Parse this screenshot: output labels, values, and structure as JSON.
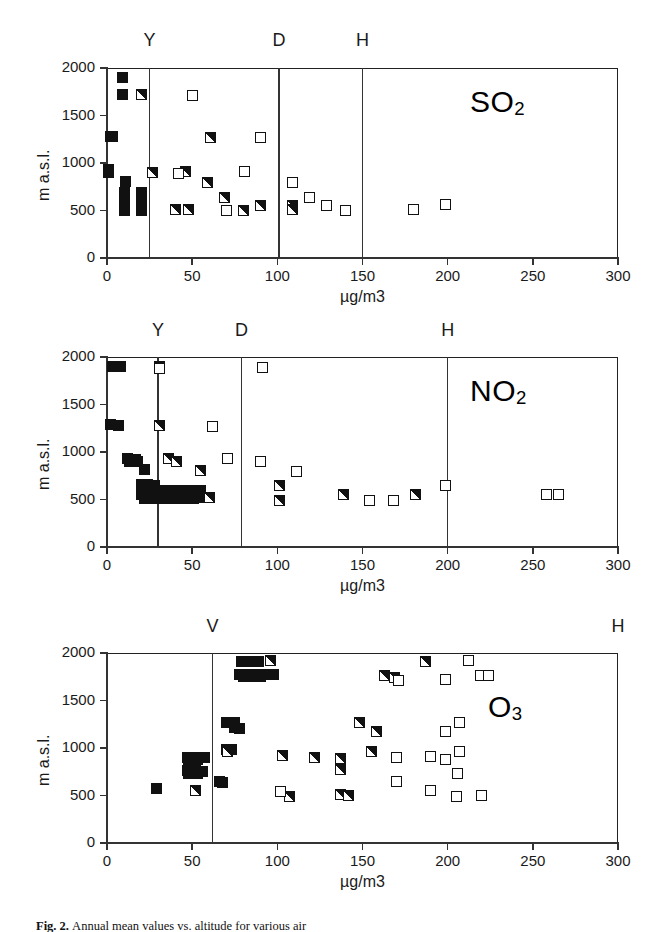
{
  "figure": {
    "caption_prefix": "Fig. 2.",
    "caption_text": "Annual mean values vs. altitude for various air"
  },
  "axes_common": {
    "xlabel": "µg/m3",
    "ylabel": "m a.s.l.",
    "xticks": [
      0,
      50,
      100,
      150,
      200,
      250,
      300
    ],
    "yticks": [
      0,
      500,
      1000,
      1500,
      2000
    ],
    "xlim": [
      0,
      300
    ],
    "ylim": [
      0,
      2000
    ],
    "grid": false
  },
  "legend_markers": {
    "filled": "filled-square",
    "half": "half-filled-square",
    "open": "open-square"
  },
  "chart_data": [
    {
      "type": "scatter",
      "title": "SO2",
      "title_plain": "SO",
      "title_sub": "2",
      "xlabel": "µg/m3",
      "ylabel": "m a.s.l.",
      "xlim": [
        0,
        300
      ],
      "ylim": [
        0,
        2000
      ],
      "xticks": [
        0,
        50,
        100,
        150,
        200,
        250,
        300
      ],
      "yticks": [
        0,
        500,
        1000,
        1500,
        2000
      ],
      "grid": false,
      "guides": [
        {
          "label": "Y",
          "x": 25
        },
        {
          "label": "D",
          "x": 101
        },
        {
          "label": "H",
          "x": 150
        }
      ],
      "series": [
        {
          "name": "filled",
          "marker": "filled-square",
          "points": [
            [
              9,
              1900
            ],
            [
              9,
              1720
            ],
            [
              2,
              1280
            ],
            [
              3,
              1275
            ],
            [
              1,
              930
            ],
            [
              1,
              900
            ],
            [
              11,
              810
            ],
            [
              10,
              690
            ],
            [
              10,
              640
            ],
            [
              10,
              590
            ],
            [
              10,
              540
            ],
            [
              10,
              500
            ],
            [
              20,
              690
            ],
            [
              20,
              640
            ],
            [
              20,
              590
            ],
            [
              20,
              540
            ],
            [
              20,
              500
            ]
          ]
        },
        {
          "name": "half",
          "marker": "half-filled-square",
          "points": [
            [
              20,
              1720
            ],
            [
              61,
              1270
            ],
            [
              27,
              900
            ],
            [
              46,
              910
            ],
            [
              59,
              800
            ],
            [
              69,
              640
            ],
            [
              40,
              510
            ],
            [
              48,
              515
            ],
            [
              80,
              505
            ],
            [
              90,
              550
            ],
            [
              109,
              555
            ],
            [
              109,
              510
            ]
          ]
        },
        {
          "name": "open",
          "marker": "open-square",
          "points": [
            [
              50,
              1710
            ],
            [
              90,
              1265
            ],
            [
              42,
              890
            ],
            [
              81,
              915
            ],
            [
              109,
              790
            ],
            [
              70,
              495
            ],
            [
              119,
              640
            ],
            [
              129,
              550
            ],
            [
              140,
              500
            ],
            [
              180,
              510
            ],
            [
              199,
              560
            ]
          ]
        }
      ]
    },
    {
      "type": "scatter",
      "title": "NO2",
      "title_plain": "NO",
      "title_sub": "2",
      "xlabel": "µg/m3",
      "ylabel": "m a.s.l.",
      "xlim": [
        0,
        300
      ],
      "ylim": [
        0,
        2000
      ],
      "xticks": [
        0,
        50,
        100,
        150,
        200,
        250,
        300
      ],
      "yticks": [
        0,
        500,
        1000,
        1500,
        2000
      ],
      "grid": false,
      "guides": [
        {
          "label": "Y",
          "x": 30
        },
        {
          "label": "D",
          "x": 79
        },
        {
          "label": "H",
          "x": 200
        }
      ],
      "series": [
        {
          "name": "filled",
          "marker": "filled-square",
          "points": [
            [
              3,
              1905
            ],
            [
              8,
              1900
            ],
            [
              2,
              1285
            ],
            [
              7,
              1280
            ],
            [
              12,
              930
            ],
            [
              17,
              925
            ],
            [
              13,
              900
            ],
            [
              18,
              900
            ],
            [
              22,
              820
            ],
            [
              20,
              660
            ],
            [
              24,
              655
            ],
            [
              28,
              650
            ],
            [
              21,
              600
            ],
            [
              25,
              600
            ],
            [
              29,
              600
            ],
            [
              33,
              600
            ],
            [
              20,
              550
            ],
            [
              24,
              550
            ],
            [
              28,
              550
            ],
            [
              32,
              550
            ],
            [
              22,
              510
            ],
            [
              26,
              510
            ],
            [
              30,
              510
            ],
            [
              34,
              510
            ],
            [
              38,
              600
            ],
            [
              42,
              600
            ],
            [
              46,
              600
            ],
            [
              50,
              600
            ],
            [
              40,
              550
            ],
            [
              44,
              550
            ],
            [
              48,
              550
            ],
            [
              52,
              550
            ],
            [
              39,
              510
            ],
            [
              43,
              510
            ],
            [
              47,
              510
            ],
            [
              51,
              510
            ],
            [
              55,
              600
            ],
            [
              55,
              555
            ],
            [
              57,
              520
            ]
          ]
        },
        {
          "name": "half",
          "marker": "half-filled-square",
          "points": [
            [
              31,
              1900
            ],
            [
              31,
              1275
            ],
            [
              36,
              930
            ],
            [
              41,
              905
            ],
            [
              55,
              810
            ],
            [
              60,
              525
            ],
            [
              101,
              650
            ],
            [
              101,
              490
            ],
            [
              139,
              555
            ],
            [
              181,
              555
            ]
          ]
        },
        {
          "name": "open",
          "marker": "open-square",
          "points": [
            [
              31,
              1880
            ],
            [
              91,
              1885
            ],
            [
              62,
              1270
            ],
            [
              71,
              935
            ],
            [
              90,
              905
            ],
            [
              111,
              800
            ],
            [
              154,
              490
            ],
            [
              168,
              490
            ],
            [
              199,
              645
            ],
            [
              258,
              550
            ],
            [
              265,
              548
            ]
          ]
        }
      ]
    },
    {
      "type": "scatter",
      "title": "O3",
      "title_plain": "O",
      "title_sub": "3",
      "xlabel": "µg/m3",
      "ylabel": "m a.s.l.",
      "xlim": [
        0,
        300
      ],
      "ylim": [
        0,
        2000
      ],
      "xticks": [
        0,
        50,
        100,
        150,
        200,
        250,
        300
      ],
      "yticks": [
        0,
        500,
        1000,
        1500,
        2000
      ],
      "grid": false,
      "guides": [
        {
          "label": "V",
          "x": 62
        },
        {
          "label": "H",
          "x": 300
        }
      ],
      "series": [
        {
          "name": "filled",
          "marker": "filled-square",
          "points": [
            [
              79,
              1915
            ],
            [
              84,
              1915
            ],
            [
              89,
              1915
            ],
            [
              78,
              1775
            ],
            [
              83,
              1775
            ],
            [
              88,
              1775
            ],
            [
              93,
              1775
            ],
            [
              98,
              1775
            ],
            [
              80,
              1755
            ],
            [
              85,
              1755
            ],
            [
              90,
              1755
            ],
            [
              70,
              1270
            ],
            [
              75,
              1270
            ],
            [
              75,
              1220
            ],
            [
              78,
              1210
            ],
            [
              70,
              985
            ],
            [
              73,
              980
            ],
            [
              47,
              905
            ],
            [
              52,
              905
            ],
            [
              57,
              900
            ],
            [
              48,
              880
            ],
            [
              53,
              875
            ],
            [
              47,
              765
            ],
            [
              52,
              760
            ],
            [
              56,
              755
            ],
            [
              48,
              735
            ],
            [
              53,
              730
            ],
            [
              29,
              570
            ],
            [
              66,
              650
            ],
            [
              68,
              640
            ]
          ]
        },
        {
          "name": "half",
          "marker": "half-filled-square",
          "points": [
            [
              96,
              1920
            ],
            [
              163,
              1760
            ],
            [
              169,
              1745
            ],
            [
              187,
              1910
            ],
            [
              148,
              1270
            ],
            [
              158,
              1175
            ],
            [
              71,
              965
            ],
            [
              103,
              925
            ],
            [
              122,
              900
            ],
            [
              137,
              890
            ],
            [
              155,
              965
            ],
            [
              137,
              775
            ],
            [
              52,
              555
            ],
            [
              107,
              490
            ],
            [
              137,
              510
            ],
            [
              142,
              500
            ]
          ]
        },
        {
          "name": "open",
          "marker": "open-square",
          "points": [
            [
              212,
              1920
            ],
            [
              199,
              1720
            ],
            [
              219,
              1760
            ],
            [
              224,
              1760
            ],
            [
              171,
              1715
            ],
            [
              207,
              1270
            ],
            [
              199,
              1175
            ],
            [
              170,
              895
            ],
            [
              190,
              915
            ],
            [
              199,
              880
            ],
            [
              207,
              965
            ],
            [
              206,
              730
            ],
            [
              102,
              545
            ],
            [
              170,
              650
            ],
            [
              190,
              555
            ],
            [
              205,
              490
            ],
            [
              220,
              500
            ]
          ]
        }
      ]
    }
  ]
}
